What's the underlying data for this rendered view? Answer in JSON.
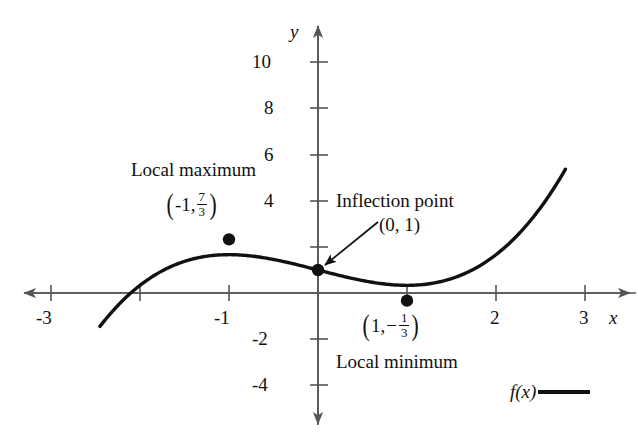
{
  "figure": {
    "background_color": "#ffffff",
    "curve_color": "#111111",
    "axis_color": "#555555",
    "point_color": "#111111"
  },
  "axes": {
    "x_axis_label": "x",
    "y_axis_label": "y",
    "x_ticks_labeled": [
      "-3",
      "-1",
      "2",
      "3"
    ],
    "y_ticks_labeled": [
      "10",
      "8",
      "6",
      "4",
      "-2",
      "-4"
    ]
  },
  "annotations": {
    "local_max_title": "Local maximum",
    "local_max_point_x": "-1,",
    "local_max_point_num": "7",
    "local_max_point_den": "3",
    "inflection_title": "Inflection point",
    "inflection_point": "(0, 1)",
    "local_min_point_x": "1,",
    "local_min_point_num": "1",
    "local_min_point_den": "3",
    "local_min_title": "Local minimum"
  },
  "legend": {
    "series_label": "f(x)"
  },
  "chart_data": {
    "type": "line",
    "title": "",
    "xlabel": "x",
    "ylabel": "y",
    "xlim": [
      -3.4,
      3.4
    ],
    "ylim": [
      -5.0,
      11.2
    ],
    "grid": false,
    "legend_position": "bottom-right",
    "x_tick_values": [
      -3,
      -2,
      -1,
      1,
      2,
      3
    ],
    "x_tick_labels": [
      "-3",
      "",
      "-1",
      "",
      "2",
      "3"
    ],
    "y_tick_values": [
      -4,
      -2,
      2,
      4,
      6,
      8,
      10
    ],
    "y_tick_labels": [
      "-4",
      "-2",
      "",
      "4",
      "6",
      "8",
      "10"
    ],
    "series": [
      {
        "name": "f(x)",
        "expression": "x^3/3 - x + 1",
        "x_domain": [
          -2.45,
          2.78
        ],
        "points": [
          [
            -2.45,
            -3.45
          ],
          [
            -2.3,
            -2.76
          ],
          [
            -2.2,
            -2.35
          ],
          [
            -2.1,
            -1.99
          ],
          [
            -2.0,
            -1.67
          ],
          [
            -1.9,
            -1.39
          ],
          [
            -1.8,
            -1.14
          ],
          [
            -1.7,
            -0.94
          ],
          [
            -1.6,
            -0.77
          ],
          [
            -1.5,
            -0.63
          ],
          [
            -1.4,
            -0.51
          ],
          [
            -1.3,
            -0.43
          ],
          [
            -1.2,
            -0.38
          ],
          [
            -1.1,
            -0.34
          ],
          [
            -1.0,
            -0.33
          ],
          [
            -0.9,
            -0.34
          ],
          [
            -0.8,
            -0.37
          ],
          [
            -0.7,
            -0.41
          ],
          [
            -0.6,
            -0.47
          ],
          [
            -0.5,
            -0.54
          ],
          [
            -0.4,
            -0.61
          ],
          [
            -0.3,
            -0.71
          ],
          [
            -0.2,
            -0.8
          ],
          [
            -0.1,
            -0.9
          ],
          [
            0.0,
            -1.0
          ],
          [
            0.1,
            -1.1
          ],
          [
            0.2,
            -1.2
          ],
          [
            0.3,
            -1.29
          ],
          [
            0.4,
            -1.38
          ],
          [
            0.5,
            -1.46
          ],
          [
            0.6,
            -1.53
          ],
          [
            0.7,
            -1.59
          ],
          [
            0.8,
            -1.63
          ],
          [
            0.9,
            -1.66
          ],
          [
            1.0,
            -1.67
          ],
          [
            1.1,
            -1.66
          ],
          [
            1.2,
            -1.62
          ],
          [
            1.3,
            -1.57
          ],
          [
            1.4,
            -1.49
          ],
          [
            1.5,
            -1.38
          ],
          [
            1.6,
            -1.23
          ],
          [
            1.7,
            -1.06
          ],
          [
            1.8,
            -0.86
          ],
          [
            1.9,
            -0.61
          ],
          [
            2.0,
            -0.33
          ],
          [
            2.1,
            -0.01
          ],
          [
            2.2,
            0.35
          ],
          [
            2.3,
            0.76
          ],
          [
            2.4,
            1.21
          ],
          [
            2.5,
            1.71
          ],
          [
            2.6,
            2.26
          ],
          [
            2.7,
            2.86
          ],
          [
            2.78,
            3.36
          ]
        ]
      }
    ],
    "marked_points": [
      {
        "label": "Local maximum",
        "coords": "(-1, 7/3)",
        "x": -1,
        "y": 2.3333
      },
      {
        "label": "Inflection point",
        "coords": "(0, 1)",
        "x": 0,
        "y": 1
      },
      {
        "label": "Local minimum",
        "coords": "(1, -1/3)",
        "x": 1,
        "y": -0.3333
      }
    ]
  }
}
